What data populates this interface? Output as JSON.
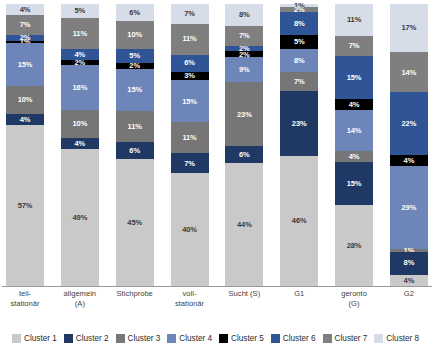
{
  "chart_data": {
    "type": "bar",
    "subtype": "stacked-bar-100-percent",
    "title": "",
    "subtitle": "",
    "xlabel": "",
    "ylabel": "",
    "ylim": [
      0,
      100
    ],
    "grid": false,
    "legend_position": "bottom",
    "value_suffix": "%",
    "categories": [
      "teil-\nstationär",
      "allgemein\n(A)",
      "Stichprobe",
      "voll-\nstationär",
      "Sucht (S)",
      "G1",
      "geronto\n(G)",
      "G2"
    ],
    "series": [
      {
        "name": "Cluster 1",
        "color": "#c9c9c9",
        "values": [
          57,
          49,
          45,
          40,
          44,
          46,
          28,
          4
        ]
      },
      {
        "name": "Cluster 2",
        "color": "#1f3864",
        "values": [
          4,
          4,
          6,
          7,
          6,
          23,
          15,
          8
        ]
      },
      {
        "name": "Cluster 3",
        "color": "#767676",
        "values": [
          10,
          10,
          11,
          11,
          23,
          7,
          4,
          1
        ]
      },
      {
        "name": "Cluster 4",
        "color": "#6d85b8",
        "values": [
          15,
          16,
          15,
          15,
          9,
          8,
          14,
          29
        ]
      },
      {
        "name": "Cluster 5",
        "color": "#000000",
        "values": [
          1,
          2,
          2,
          3,
          2,
          5,
          4,
          4
        ]
      },
      {
        "name": "Cluster 6",
        "color": "#2f5597",
        "values": [
          2,
          4,
          5,
          6,
          2,
          8,
          15,
          22
        ]
      },
      {
        "name": "Cluster 7",
        "color": "#7f7f7f",
        "values": [
          7,
          11,
          10,
          11,
          7,
          2,
          7,
          14
        ]
      },
      {
        "name": "Cluster 8",
        "color": "#d6dce8",
        "values": [
          4,
          5,
          6,
          7,
          8,
          1,
          11,
          17
        ]
      }
    ],
    "stack_order_top_to_bottom": [
      "Cluster 8",
      "Cluster 7",
      "Cluster 6",
      "Cluster 5",
      "Cluster 4",
      "Cluster 3",
      "Cluster 2",
      "Cluster 1"
    ]
  },
  "legend": {
    "items": [
      {
        "label": "Cluster 1",
        "color": "#c9c9c9"
      },
      {
        "label": "Cluster 2",
        "color": "#1f3864"
      },
      {
        "label": "Cluster 3",
        "color": "#767676"
      },
      {
        "label": "Cluster 4",
        "color": "#6d85b8"
      },
      {
        "label": "Cluster 5",
        "color": "#000000"
      },
      {
        "label": "Cluster 6",
        "color": "#2f5597"
      },
      {
        "label": "Cluster 7",
        "color": "#7f7f7f"
      },
      {
        "label": "Cluster 8",
        "color": "#d6dce8"
      }
    ]
  },
  "axis": {
    "line_color": "#9a9a9a"
  }
}
